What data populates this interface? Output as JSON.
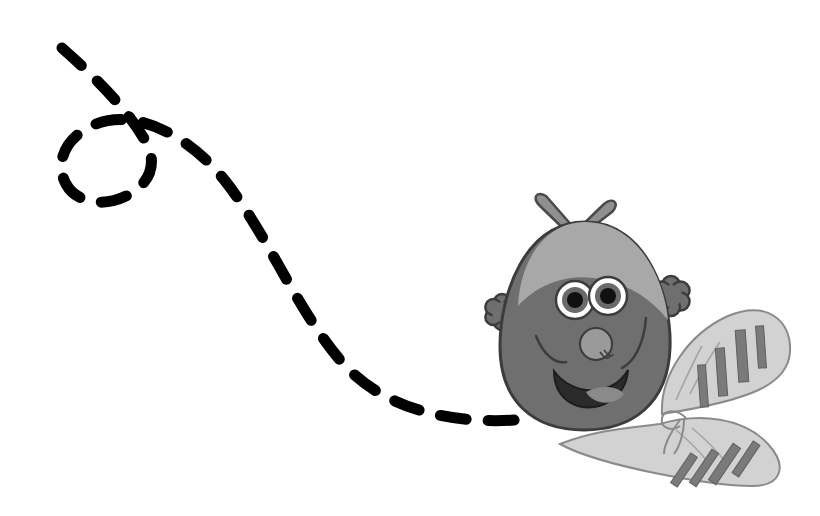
{
  "canvas": {
    "width": 820,
    "height": 516,
    "background": "#ffffff",
    "title": "Cartoon bee with dashed flight trail"
  },
  "palette": {
    "trail": "#000000",
    "body": "#6f6f6f",
    "body_outline": "#3c3c3c",
    "head_cap": "#a8a8a8",
    "nose": "#9a9a9a",
    "eye_white": "#ffffff",
    "eye_iris": "#6a6a6a",
    "eye_pupil": "#111111",
    "mouth": "#2b2b2b",
    "tongue": "#8a8a8a",
    "wing": "#d2d2d2",
    "wing_outline": "#8a8a8a",
    "wing_stripe": "#7a7a7a",
    "bow": "#8f8f8f",
    "bow_outline": "#4a4a4a",
    "hand": "#6f6f6f",
    "hand_outline": "#3c3c3c"
  },
  "trail": {
    "label": "Dashed flight trail",
    "stroke_width": 11,
    "dash_pattern": "26 22",
    "linecap": "round",
    "path": "M 62 48 C 96 78, 128 110, 146 142 C 156 160, 152 178, 136 190 C 112 208, 78 206, 66 184 C 54 162, 66 136, 96 124 C 136 108, 190 136, 226 182 C 268 236, 296 308, 340 360 C 382 410, 452 424, 516 420"
  },
  "bee": {
    "label": "Cartoon bee character",
    "body": {
      "label": "Bee body",
      "path": "M 585 222 C 648 222, 672 300, 670 348 C 668 404, 632 430, 584 430 C 534 430, 500 402, 500 346 C 500 296, 524 222, 585 222 Z"
    },
    "head_cap": {
      "label": "Light hair cap",
      "path": "M 585 222 C 636 222, 664 276, 668 320 C 652 300, 632 286, 604 280 C 572 272, 540 282, 518 306 C 520 262, 544 222, 585 222 Z"
    },
    "bow": {
      "label": "Hair bow",
      "knot_cx": 571,
      "knot_cy": 236,
      "knot_r": 7,
      "loops": [
        "M 571 236 L 540 206 C 532 198, 536 190, 546 196 L 574 228 Z",
        "M 571 236 L 604 204 C 614 196, 620 204, 612 212 L 578 238 Z",
        "M 571 236 L 546 270 C 538 280, 546 286, 554 278 L 576 244 Z",
        "M 571 236 L 602 268 C 610 278, 602 284, 594 276 L 576 242 Z"
      ]
    },
    "eyes": [
      {
        "label": "Left eye",
        "cx": 575,
        "cy": 300,
        "r_white": 19,
        "r_iris": 13,
        "r_pupil": 8
      },
      {
        "label": "Right eye",
        "cx": 608,
        "cy": 296,
        "r_white": 19,
        "r_iris": 13,
        "r_pupil": 8
      }
    ],
    "nose": {
      "label": "Nose",
      "cx": 596,
      "cy": 344,
      "r": 16
    },
    "mouth": {
      "label": "Open smiling mouth",
      "path": "M 554 371 C 572 396, 612 398, 628 370 C 626 398, 600 412, 578 406 C 562 401, 554 388, 554 371 Z",
      "tongue": "M 586 392 C 600 384, 618 386, 624 394 C 616 406, 594 406, 586 392 Z"
    },
    "cheeks": [
      {
        "label": "Left cheek line",
        "path": "M 536 336 C 544 356, 556 364, 566 362"
      },
      {
        "label": "Right cheek line",
        "path": "M 646 318 C 644 344, 634 362, 622 368"
      }
    ],
    "arms": [
      {
        "label": "Left arm",
        "path": "M 520 326 L 500 314"
      },
      {
        "label": "Right arm",
        "path": "M 650 304 L 666 296"
      }
    ],
    "hands": [
      {
        "label": "Left hand",
        "cx": 502,
        "cy": 312,
        "petals": 6,
        "petal_r": 8,
        "ring_r": 10
      },
      {
        "label": "Right hand",
        "cx": 671,
        "cy": 296,
        "petals": 6,
        "petal_r": 9,
        "ring_r": 11
      }
    ],
    "wings": [
      {
        "label": "Upper wing",
        "path": "M 662 414 C 660 376, 688 334, 728 316 C 766 300, 792 320, 790 352 C 788 384, 752 400, 662 414 Z",
        "veins": [
          "M 676 400 C 686 378, 694 360, 702 346",
          "M 690 394 C 700 374, 710 356, 720 342"
        ],
        "stripes": [
          {
            "x": 699,
            "y": 365,
            "w": 8,
            "h": 42,
            "angle": -4
          },
          {
            "x": 717,
            "y": 348,
            "w": 9,
            "h": 48,
            "angle": -4
          },
          {
            "x": 737,
            "y": 330,
            "w": 10,
            "h": 52,
            "angle": -4
          },
          {
            "x": 757,
            "y": 326,
            "w": 8,
            "h": 42,
            "angle": -4
          }
        ]
      },
      {
        "label": "Lower wing",
        "path": "M 660 424 C 700 412, 744 418, 768 444 C 788 466, 782 486, 752 486 C 712 486, 600 466, 560 444 C 596 430, 628 428, 660 424 Z",
        "veins": [
          "M 676 430 C 688 440, 700 452, 708 462",
          "M 692 428 C 704 438, 716 450, 724 460"
        ],
        "stripes": [
          {
            "x": 680,
            "y": 452,
            "w": 8,
            "h": 36,
            "angle": 34
          },
          {
            "x": 700,
            "y": 448,
            "w": 8,
            "h": 40,
            "angle": 34
          },
          {
            "x": 720,
            "y": 442,
            "w": 9,
            "h": 44,
            "angle": 34
          },
          {
            "x": 742,
            "y": 440,
            "w": 8,
            "h": 38,
            "angle": 34
          }
        ]
      }
    ],
    "wing_knot": {
      "label": "Wing ribbon knot",
      "paths": [
        "M 686 418 C 676 408, 664 410, 662 418 C 660 428, 672 432, 680 426",
        "M 680 420 C 672 430, 664 444, 664 454",
        "M 684 420 C 684 432, 680 446, 674 454"
      ]
    }
  }
}
